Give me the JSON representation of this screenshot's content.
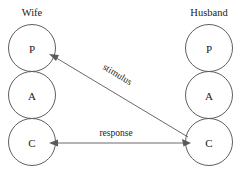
{
  "diagram": {
    "type": "transactional-analysis-ego-state-diagram",
    "background_color": "#ffffff",
    "line_color": "#5a5a5a",
    "circle_stroke_color": "#4d4d4d",
    "text_color": "#1a1a1a",
    "columns": [
      {
        "id": "wife",
        "header": "Wife",
        "header_x": 32,
        "header_y": 16,
        "center_x": 32,
        "states": [
          {
            "id": "wife-p",
            "letter": "P",
            "cy": 48,
            "r": 23.5
          },
          {
            "id": "wife-a",
            "letter": "A",
            "cy": 95,
            "r": 23.5
          },
          {
            "id": "wife-c",
            "letter": "C",
            "cy": 142,
            "r": 23.5
          }
        ]
      },
      {
        "id": "husband",
        "header": "Husband",
        "header_x": 209,
        "header_y": 16,
        "center_x": 209,
        "states": [
          {
            "id": "husband-p",
            "letter": "P",
            "cy": 48,
            "r": 23.5
          },
          {
            "id": "husband-a",
            "letter": "A",
            "cy": 95,
            "r": 23.5
          },
          {
            "id": "husband-c",
            "letter": "C",
            "cy": 142,
            "r": 23.5
          }
        ]
      }
    ],
    "transactions": [
      {
        "id": "stimulus",
        "label": "stimulus",
        "from": "husband-c",
        "to": "wife-p",
        "direction": "right-to-left",
        "label_x": 116,
        "label_y": 77,
        "label_rotation": 31,
        "x1": 187,
        "y1": 136,
        "x2": 52,
        "y2": 55
      },
      {
        "id": "response",
        "label": "response",
        "from": "husband-c",
        "to": "wife-c",
        "direction": "right-to-left",
        "label_x": 116,
        "label_y": 136,
        "label_rotation": 0,
        "x1": 186,
        "y1": 143,
        "x2": 56,
        "y2": 143
      }
    ],
    "extra_arrowheads": [
      {
        "id": "stimulus-head-right",
        "x": 190,
        "y": 143,
        "rotation": 0
      }
    ]
  }
}
